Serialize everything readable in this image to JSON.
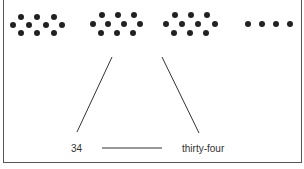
{
  "diagram": {
    "dot_groups": [
      {
        "name": "group-1",
        "count": 10,
        "dots": [
          [
            21,
            17
          ],
          [
            37,
            17
          ],
          [
            54,
            17
          ],
          [
            13,
            25
          ],
          [
            29,
            25
          ],
          [
            46,
            25
          ],
          [
            62,
            25
          ],
          [
            21,
            33
          ],
          [
            37,
            33
          ],
          [
            54,
            33
          ]
        ]
      },
      {
        "name": "group-2",
        "count": 10,
        "dots": [
          [
            102,
            15
          ],
          [
            118,
            15
          ],
          [
            134,
            15
          ],
          [
            93,
            24
          ],
          [
            108,
            24
          ],
          [
            124,
            24
          ],
          [
            140,
            24
          ],
          [
            101,
            33
          ],
          [
            117,
            33
          ],
          [
            133,
            33
          ]
        ]
      },
      {
        "name": "group-3",
        "count": 10,
        "dots": [
          [
            175,
            15
          ],
          [
            191,
            15
          ],
          [
            207,
            15
          ],
          [
            166,
            24
          ],
          [
            182,
            24
          ],
          [
            198,
            24
          ],
          [
            215,
            24
          ],
          [
            174,
            33
          ],
          [
            190,
            33
          ],
          [
            206,
            33
          ]
        ]
      },
      {
        "name": "group-4",
        "count": 4,
        "dots": [
          [
            248,
            24
          ],
          [
            262,
            24
          ],
          [
            276,
            24
          ],
          [
            290,
            24
          ]
        ]
      }
    ],
    "dot_color": "#222222",
    "dot_radius": 3,
    "connector_lines": [
      {
        "name": "line-to-numeral",
        "x1": 112,
        "y1": 57,
        "x2": 77,
        "y2": 132
      },
      {
        "name": "line-to-word",
        "x1": 162,
        "y1": 57,
        "x2": 199,
        "y2": 133
      }
    ],
    "answer_blank": {
      "x1": 102,
      "y1": 148,
      "x2": 162,
      "y2": 148
    },
    "labels": {
      "numeral": "34",
      "word": "thirty-four"
    }
  }
}
